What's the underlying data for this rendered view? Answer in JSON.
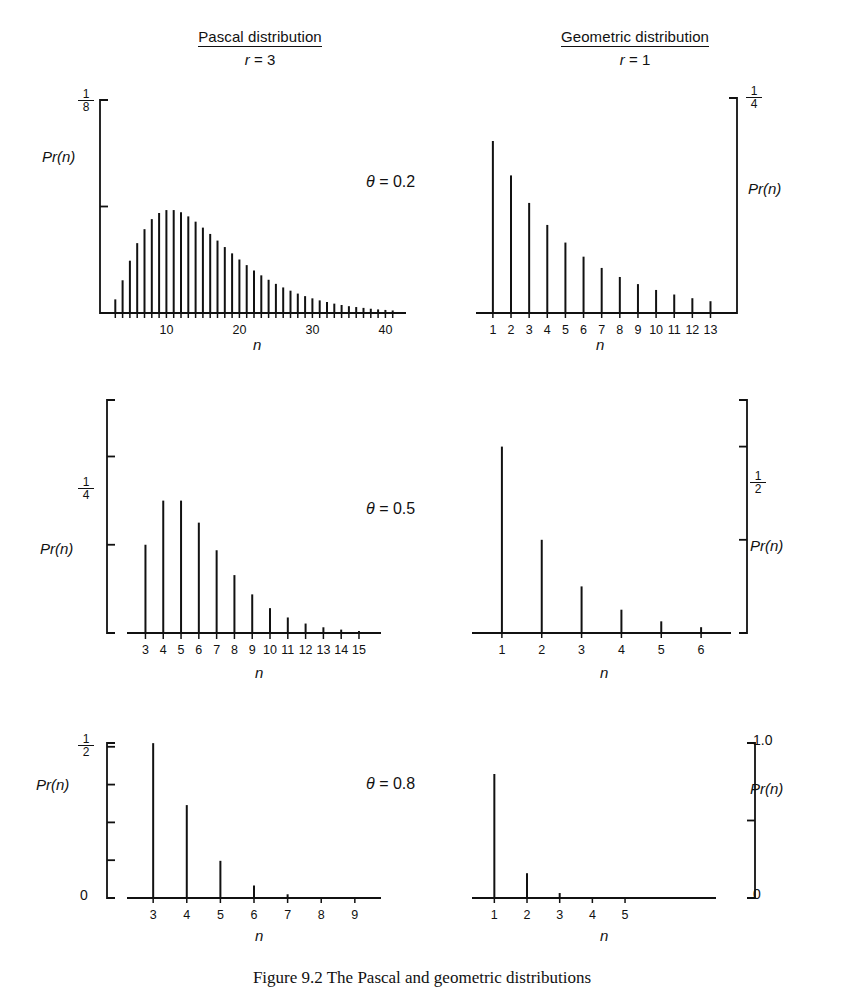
{
  "figure": {
    "caption": "Figure 9.2 The Pascal and geometric distributions",
    "columns": [
      {
        "title": "Pascal distribution",
        "param_label": "r",
        "param_value": "3"
      },
      {
        "title": "Geometric distribution",
        "param_label": "r",
        "param_value": "1"
      }
    ],
    "row_params": [
      "θ = 0.2",
      "θ = 0.5",
      "θ = 0.8"
    ],
    "axis_label_x": "n",
    "axis_label_y": "Pr(n)"
  },
  "chart_data": [
    {
      "id": "pascal-theta-0.2",
      "type": "bar",
      "title": "Pascal distribution",
      "xlabel": "n",
      "ylabel": "Pr(n)",
      "annotation": "θ = 0.2",
      "r": 3,
      "theta": 0.2,
      "y_axis_side": "left",
      "ylim": [
        0,
        0.125
      ],
      "ytick_values": [
        0.125,
        0.0625,
        0
      ],
      "ytick_labels": [
        "1/8",
        "",
        ""
      ],
      "ytick_label_top": {
        "numerator": "1",
        "denominator": "8"
      },
      "xlim": [
        2,
        42
      ],
      "xtick_labels": [
        "10",
        "20",
        "30",
        "40"
      ],
      "xtick_label_values": [
        10,
        20,
        30,
        40
      ],
      "x": [
        3,
        4,
        5,
        6,
        7,
        8,
        9,
        10,
        11,
        12,
        13,
        14,
        15,
        16,
        17,
        18,
        19,
        20,
        21,
        22,
        23,
        24,
        25,
        26,
        27,
        28,
        29,
        30,
        31,
        32,
        33,
        34,
        35,
        36,
        37,
        38,
        39,
        40,
        41
      ],
      "values": [
        0.008,
        0.0192,
        0.0307,
        0.041,
        0.0492,
        0.0551,
        0.0587,
        0.0604,
        0.0604,
        0.0591,
        0.0567,
        0.0536,
        0.0501,
        0.0464,
        0.0425,
        0.0387,
        0.035,
        0.0314,
        0.0281,
        0.025,
        0.0221,
        0.0195,
        0.0171,
        0.015,
        0.0131,
        0.0114,
        0.0099,
        0.0086,
        0.0074,
        0.0064,
        0.0055,
        0.0047,
        0.004,
        0.0035,
        0.003,
        0.0025,
        0.0021,
        0.0018,
        0.0015
      ]
    },
    {
      "id": "geometric-theta-0.2",
      "type": "bar",
      "title": "Geometric distribution",
      "xlabel": "n",
      "ylabel": "Pr(n)",
      "annotation": "θ = 0.2",
      "r": 1,
      "theta": 0.2,
      "y_axis_side": "right",
      "ylim": [
        0,
        0.25
      ],
      "ytick_values": [
        0.25,
        0
      ],
      "ytick_label_top": {
        "numerator": "1",
        "denominator": "4"
      },
      "xlim": [
        0.4,
        13.8
      ],
      "xtick_labels": [
        "1",
        "2",
        "3",
        "4",
        "5",
        "6",
        "7",
        "8",
        "9",
        "10",
        "11",
        "12",
        "13"
      ],
      "xtick_label_values": [
        1,
        2,
        3,
        4,
        5,
        6,
        7,
        8,
        9,
        10,
        11,
        12,
        13
      ],
      "x": [
        1,
        2,
        3,
        4,
        5,
        6,
        7,
        8,
        9,
        10,
        11,
        12,
        13
      ],
      "values": [
        0.2,
        0.16,
        0.128,
        0.1024,
        0.0819,
        0.0655,
        0.0524,
        0.0419,
        0.0336,
        0.0268,
        0.0215,
        0.0172,
        0.0137
      ]
    },
    {
      "id": "pascal-theta-0.5",
      "type": "bar",
      "title": "Pascal distribution",
      "xlabel": "n",
      "ylabel": "Pr(n)",
      "annotation": "θ = 0.5",
      "r": 3,
      "theta": 0.5,
      "y_axis_side": "left",
      "ylim": [
        0,
        0.33
      ],
      "ytick_values": [
        0.25,
        0.125
      ],
      "ytick_label_mid": {
        "numerator": "1",
        "denominator": "4"
      },
      "xlim": [
        2.3,
        15.9
      ],
      "xtick_labels": [
        "3",
        "4",
        "5",
        "6",
        "7",
        "8",
        "9",
        "10",
        "11",
        "12",
        "13",
        "14",
        "15"
      ],
      "xtick_label_values": [
        3,
        4,
        5,
        6,
        7,
        8,
        9,
        10,
        11,
        12,
        13,
        14,
        15
      ],
      "x": [
        3,
        4,
        5,
        6,
        7,
        8,
        9,
        10,
        11,
        12,
        13,
        14,
        15
      ],
      "values": [
        0.125,
        0.1875,
        0.1875,
        0.1563,
        0.1172,
        0.082,
        0.0547,
        0.0352,
        0.022,
        0.0134,
        0.0081,
        0.0048,
        0.0028
      ]
    },
    {
      "id": "geometric-theta-0.5",
      "type": "bar",
      "title": "Geometric distribution",
      "xlabel": "n",
      "ylabel": "Pr(n)",
      "annotation": "θ = 0.5",
      "r": 1,
      "theta": 0.5,
      "y_axis_side": "right",
      "ylim": [
        0,
        0.625
      ],
      "ytick_values": [
        0.5,
        0.25
      ],
      "ytick_label_top": {
        "numerator": "1",
        "denominator": "2"
      },
      "xlim": [
        0.4,
        6.6
      ],
      "xtick_labels": [
        "1",
        "2",
        "3",
        "4",
        "5",
        "6"
      ],
      "xtick_label_values": [
        1,
        2,
        3,
        4,
        5,
        6
      ],
      "x": [
        1,
        2,
        3,
        4,
        5,
        6
      ],
      "values": [
        0.5,
        0.25,
        0.125,
        0.0625,
        0.0313,
        0.0156
      ]
    },
    {
      "id": "pascal-theta-0.8",
      "type": "bar",
      "title": "Pascal distribution",
      "xlabel": "n",
      "ylabel": "Pr(n)",
      "annotation": "θ = 0.8",
      "r": 3,
      "theta": 0.8,
      "y_axis_side": "left",
      "ylim": [
        0,
        0.5125
      ],
      "ytick_values": [
        0.5,
        0.375,
        0.25,
        0.125,
        0
      ],
      "ytick_label_top": {
        "numerator": "1",
        "denominator": "2"
      },
      "ytick_label_bottom": "0",
      "xlim": [
        2.4,
        9.6
      ],
      "xtick_labels": [
        "3",
        "4",
        "5",
        "6",
        "7",
        "8",
        "9"
      ],
      "xtick_label_values": [
        3,
        4,
        5,
        6,
        7,
        8,
        9
      ],
      "x": [
        3,
        4,
        5,
        6,
        7,
        8,
        9
      ],
      "values": [
        0.512,
        0.3072,
        0.1229,
        0.041,
        0.0123,
        0.0034,
        0.0009
      ]
    },
    {
      "id": "geometric-theta-0.8",
      "type": "bar",
      "title": "Geometric distribution",
      "xlabel": "n",
      "ylabel": "Pr(n)",
      "annotation": "θ = 0.8",
      "r": 1,
      "theta": 0.8,
      "y_axis_side": "right",
      "ylim": [
        0,
        1.0
      ],
      "ytick_values": [
        1.0,
        0.5,
        0
      ],
      "ytick_label_top": "1.0",
      "ytick_label_bottom": "0",
      "xlim": [
        0.5,
        7.6
      ],
      "xtick_labels": [
        "1",
        "2",
        "3",
        "4",
        "5"
      ],
      "xtick_label_values": [
        1,
        2,
        3,
        4,
        5
      ],
      "x": [
        1,
        2,
        3,
        4,
        5
      ],
      "values": [
        0.8,
        0.16,
        0.032,
        0.0064,
        0.0013
      ]
    }
  ]
}
